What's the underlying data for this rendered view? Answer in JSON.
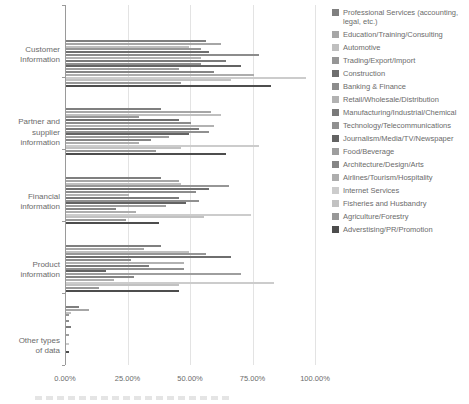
{
  "chart_data": {
    "type": "bar",
    "orientation": "horizontal",
    "title": "",
    "legend_position": "right",
    "grid": true,
    "x_axis": {
      "min": 0,
      "max": 100,
      "tick_labels": [
        "0.00%",
        "25.00%",
        "50.00%",
        "75.00%",
        "100.00%"
      ],
      "tick_values": [
        0,
        25,
        50,
        75,
        100
      ]
    },
    "categories": [
      "Customer\nInformation",
      "Partner and\nsupplier\ninformation",
      "Financial\ninformation",
      "Product\ninformation",
      "Other types\nof data"
    ],
    "series": [
      {
        "name": "Professional Services (accounting, legal, etc.)",
        "color": "#7f7f7f",
        "values": [
          56,
          38,
          38,
          38,
          5
        ]
      },
      {
        "name": "Education/Training/Consulting",
        "color": "#a6a6a6",
        "values": [
          62,
          58,
          45,
          31,
          9
        ]
      },
      {
        "name": "Automotive",
        "color": "#bfbfbf",
        "values": [
          49,
          62,
          46,
          49,
          2
        ]
      },
      {
        "name": "Trading/Export/Import",
        "color": "#969696",
        "values": [
          54,
          29,
          65,
          56,
          1
        ]
      },
      {
        "name": "Construction",
        "color": "#6e6e6e",
        "values": [
          57,
          45,
          57,
          66,
          0
        ]
      },
      {
        "name": "Banking & Finance",
        "color": "#8c8c8c",
        "values": [
          77,
          50,
          52,
          26,
          1
        ]
      },
      {
        "name": "Retail/Wholesale/Distribution",
        "color": "#b2b2b2",
        "values": [
          54,
          59,
          25,
          47,
          0
        ]
      },
      {
        "name": "Manufacturing/Industrial/Chemical",
        "color": "#7a7a7a",
        "values": [
          64,
          53,
          45,
          33,
          2
        ]
      },
      {
        "name": "Technology/Telecommunications",
        "color": "#909090",
        "values": [
          54,
          57,
          53,
          47,
          0
        ]
      },
      {
        "name": "Journalism/Media/TV/Newspaper",
        "color": "#636363",
        "values": [
          70,
          49,
          48,
          16,
          0
        ]
      },
      {
        "name": "Food/Beverage",
        "color": "#9e9e9e",
        "values": [
          45,
          41,
          40,
          70,
          1
        ]
      },
      {
        "name": "Architecture/Design/Arts",
        "color": "#858585",
        "values": [
          59,
          34,
          20,
          27,
          0
        ]
      },
      {
        "name": "Airlines/Tourism/Hospitality",
        "color": "#adadad",
        "values": [
          75,
          29,
          28,
          19,
          0
        ]
      },
      {
        "name": "Internet Services",
        "color": "#cccccc",
        "values": [
          96,
          77,
          74,
          83,
          1
        ]
      },
      {
        "name": "Fisheries and Husbandry",
        "color": "#c2c2c2",
        "values": [
          66,
          46,
          55,
          45,
          0
        ]
      },
      {
        "name": "Agriculture/Forestry",
        "color": "#989898",
        "values": [
          46,
          36,
          24,
          13,
          0
        ]
      },
      {
        "name": "Adverstising/PR/Promotion",
        "color": "#4d4d4d",
        "values": [
          82,
          64,
          37,
          45,
          1
        ]
      }
    ]
  }
}
